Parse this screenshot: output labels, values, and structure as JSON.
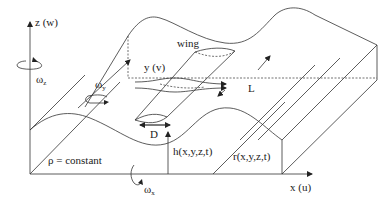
{
  "diagram": {
    "type": "3d-schematic",
    "axes": {
      "z": {
        "label": "z (w)"
      },
      "y": {
        "label": "y (v)"
      },
      "x": {
        "label": "x (u)"
      }
    },
    "rotations": {
      "omega_z": {
        "symbol": "ω",
        "sub": "z"
      },
      "omega_y": {
        "symbol": "ω",
        "sub": "y"
      },
      "omega_x": {
        "symbol": "ω",
        "sub": "x"
      }
    },
    "labels": {
      "wing": "wing",
      "length": "L",
      "width": "D",
      "density": "ρ = constant",
      "depth": "h(x,y,z,t)",
      "surface": "r(x,y,z,t)"
    },
    "colors": {
      "line": "#333333",
      "background": "#ffffff",
      "text": "#222222"
    }
  }
}
